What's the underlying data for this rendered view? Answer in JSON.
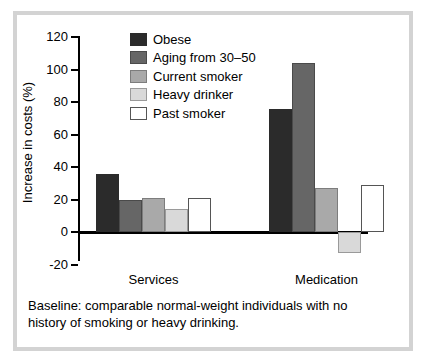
{
  "chart_data": {
    "type": "bar",
    "title": "",
    "subtitle": "",
    "xlabel": "",
    "ylabel": "Increase in costs (%)",
    "ylim": [
      -20,
      120
    ],
    "yticks": [
      120,
      100,
      80,
      60,
      40,
      20,
      0,
      -20
    ],
    "ytick_labels": [
      "120",
      "100",
      "80",
      "60",
      "40",
      "20",
      "0",
      "-20"
    ],
    "grid": false,
    "legend_position": "upper-left-inside",
    "categories": [
      "Services",
      "Medication"
    ],
    "series": [
      {
        "name": "Obese",
        "color": "#2b2b2b",
        "values": [
          36,
          76
        ]
      },
      {
        "name": "Aging from 30–50",
        "color": "#666666",
        "values": [
          20,
          104
        ]
      },
      {
        "name": "Current smoker",
        "color": "#a9a9a9",
        "values": [
          21,
          27
        ]
      },
      {
        "name": "Heavy drinker",
        "color": "#d9d9d9",
        "values": [
          14,
          -13
        ]
      },
      {
        "name": "Past smoker",
        "color": "#ffffff",
        "values": [
          21,
          29
        ]
      }
    ],
    "annotations": [
      "Baseline: comparable normal-weight individuals with no history of smoking or heavy drinking."
    ]
  },
  "caption": {
    "line1": "Baseline: comparable normal-weight individuals with no",
    "line2": "history of smoking or heavy drinking."
  },
  "legend": {
    "items": [
      {
        "label": "Obese"
      },
      {
        "label": "Aging from 30–50"
      },
      {
        "label": "Current smoker"
      },
      {
        "label": "Heavy drinker"
      },
      {
        "label": "Past smoker"
      }
    ]
  },
  "axis": {
    "y_title": "Increase in costs (%)",
    "tick_labels": [
      "120",
      "100",
      "80",
      "60",
      "40",
      "20",
      "0",
      "-20"
    ],
    "category_labels": [
      "Services",
      "Medication"
    ]
  },
  "style": {
    "frame_color": "#d3d3d3",
    "background": "#ffffff",
    "axis_color": "#000000"
  }
}
